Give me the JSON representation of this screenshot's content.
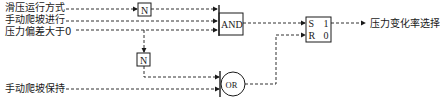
{
  "diagram": {
    "inputs": [
      {
        "id": "in1",
        "label": "滑压运行方式"
      },
      {
        "id": "in2",
        "label": "手动爬坡进行"
      },
      {
        "id": "in3",
        "label": "压力偏差大于0"
      },
      {
        "id": "in4",
        "label": "手动爬坡保持"
      }
    ],
    "gates": {
      "not1": "N",
      "not2": "N",
      "and": "AND",
      "or": "OR",
      "sr": {
        "s": "S",
        "r": "R",
        "q1": "1",
        "q0": "0"
      }
    },
    "output": {
      "label": "压力变化率选择"
    },
    "colors": {
      "line": "#1a1a1a",
      "background": "#ffffff"
    }
  }
}
